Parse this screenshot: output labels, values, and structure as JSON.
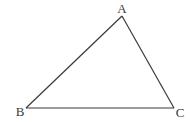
{
  "diagram": {
    "type": "triangle",
    "stroke_color": "#3a3a3a",
    "background": "#ffffff",
    "vertices": [
      {
        "name": "A",
        "label": "A",
        "x": 122,
        "y": 16,
        "label_x": 122,
        "label_y": 13,
        "anchor": "middle"
      },
      {
        "name": "B",
        "label": "B",
        "x": 26,
        "y": 108,
        "label_x": 20,
        "label_y": 116,
        "anchor": "middle"
      },
      {
        "name": "C",
        "label": "C",
        "x": 174,
        "y": 108,
        "label_x": 180,
        "label_y": 117,
        "anchor": "middle"
      }
    ],
    "edges": [
      {
        "from": "A",
        "to": "B"
      },
      {
        "from": "B",
        "to": "C"
      },
      {
        "from": "C",
        "to": "A"
      }
    ]
  }
}
